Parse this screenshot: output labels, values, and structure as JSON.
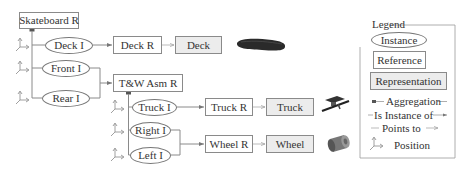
{
  "diagram": {
    "root": {
      "label": "Skateboard R",
      "kind": "reference"
    },
    "instances": [
      {
        "id": "deck_i",
        "label": "Deck I"
      },
      {
        "id": "front_i",
        "label": "Front I"
      },
      {
        "id": "rear_i",
        "label": "Rear I"
      },
      {
        "id": "truck_i",
        "label": "Truck I"
      },
      {
        "id": "right_i",
        "label": "Right I"
      },
      {
        "id": "left_i",
        "label": "Left I"
      }
    ],
    "references": [
      {
        "id": "deck_r",
        "label": "Deck R"
      },
      {
        "id": "tw_asm_r",
        "label": "T&W Asm R"
      },
      {
        "id": "truck_r",
        "label": "Truck R"
      },
      {
        "id": "wheel_r",
        "label": "Wheel R"
      }
    ],
    "representations": [
      {
        "id": "deck",
        "label": "Deck",
        "image": "skateboard-deck-image"
      },
      {
        "id": "truck",
        "label": "Truck",
        "image": "truck-image"
      },
      {
        "id": "wheel",
        "label": "Wheel",
        "image": "wheel-image"
      }
    ],
    "edges": [
      {
        "from": "Skateboard R",
        "to": "Deck I",
        "type": "aggregation"
      },
      {
        "from": "Skateboard R",
        "to": "Front I",
        "type": "aggregation"
      },
      {
        "from": "Skateboard R",
        "to": "Rear I",
        "type": "aggregation"
      },
      {
        "from": "Deck I",
        "to": "Deck R",
        "type": "is-instance-of"
      },
      {
        "from": "Front I",
        "to": "T&W Asm R",
        "type": "is-instance-of"
      },
      {
        "from": "Rear I",
        "to": "T&W Asm R",
        "type": "is-instance-of"
      },
      {
        "from": "T&W Asm R",
        "to": "Truck I",
        "type": "aggregation"
      },
      {
        "from": "T&W Asm R",
        "to": "Right I",
        "type": "aggregation"
      },
      {
        "from": "T&W Asm R",
        "to": "Left I",
        "type": "aggregation"
      },
      {
        "from": "Truck I",
        "to": "Truck R",
        "type": "is-instance-of"
      },
      {
        "from": "Right I",
        "to": "Wheel R",
        "type": "is-instance-of"
      },
      {
        "from": "Left I",
        "to": "Wheel R",
        "type": "is-instance-of"
      },
      {
        "from": "Deck R",
        "to": "Deck",
        "type": "points-to"
      },
      {
        "from": "Truck R",
        "to": "Truck",
        "type": "points-to"
      },
      {
        "from": "Wheel R",
        "to": "Wheel",
        "type": "points-to"
      }
    ]
  },
  "legend": {
    "title": "Legend",
    "instance": "Instance",
    "reference": "Reference",
    "representation": "Representation",
    "aggregation": "Aggregation",
    "is_instance_of": "Is Instance of",
    "points_to": "Points to",
    "position": "Position"
  },
  "colors": {
    "line": "#8a8a8a",
    "representation_fill": "#ececec",
    "aggregation_marker": "#555555"
  }
}
